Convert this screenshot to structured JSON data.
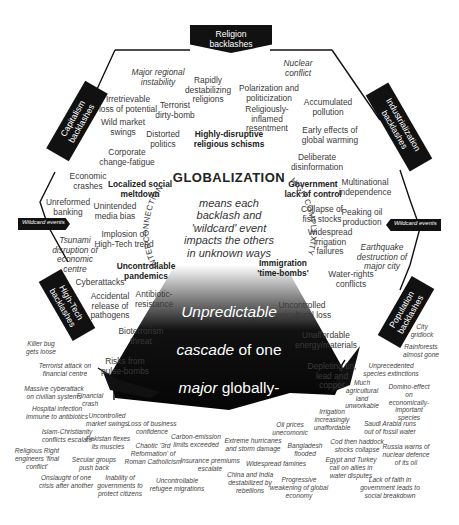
{
  "center": {
    "title": "GLOBALIZATION",
    "subtitle": "means each\nbacklash and\n'wildcard' event\nimpacts the others\nin unknown ways",
    "arc_left": "INTERCONNECTION",
    "arc_right": "HIGH COMPLEXITY",
    "cascade_line1_it": "Unpredictable",
    "cascade_line2a": "cascade",
    "cascade_line2b": " of one",
    "cascade_line3a": "major",
    "cascade_line3b": " globally-",
    "cascade_line4a": "defined",
    "cascade_line4b": " threat to",
    "cascade_line5": "economic security",
    "cascade_line6": "triggering another"
  },
  "backlashes": {
    "religion": "Religion\nbacklashes",
    "capitalism": "Capitalism\nbacklashes",
    "industrialization": "Industrialization\nbacklashes",
    "hightech": "High-Tech\nbacklashes",
    "population": "Population\nbacklashes"
  },
  "wildcards": {
    "left": "Wildcard events",
    "right": "Wildcard events"
  },
  "inner_labels": [
    {
      "t": "Major regional\ninstability",
      "x": 158,
      "y": 68,
      "s": "it"
    },
    {
      "t": "Rapidly\ndestabilizing\nreligions",
      "x": 208,
      "y": 76,
      "s": ""
    },
    {
      "t": "Nuclear\nconflict",
      "x": 298,
      "y": 59,
      "s": "it"
    },
    {
      "t": "Polarization and\npoliticization",
      "x": 269,
      "y": 84,
      "s": ""
    },
    {
      "t": "Irretrievable\nloss of potential",
      "x": 128,
      "y": 95,
      "s": ""
    },
    {
      "t": "Terrorist\ndirty-bomb",
      "x": 175,
      "y": 101,
      "s": ""
    },
    {
      "t": "Religiously-\ninflamed\nresentment",
      "x": 267,
      "y": 105,
      "s": ""
    },
    {
      "t": "Accumulated\npollution",
      "x": 328,
      "y": 98,
      "s": ""
    },
    {
      "t": "Wild market\nswings",
      "x": 123,
      "y": 118,
      "s": ""
    },
    {
      "t": "Distorted\npolitics",
      "x": 163,
      "y": 130,
      "s": ""
    },
    {
      "t": "Highly-disruptive\nreligious schisms",
      "x": 229,
      "y": 130,
      "s": "b"
    },
    {
      "t": "Early effects of\nglobal warming",
      "x": 330,
      "y": 126,
      "s": ""
    },
    {
      "t": "Corporate\nchange-fatigue",
      "x": 127,
      "y": 148,
      "s": ""
    },
    {
      "t": "Deliberate\ndisinformation",
      "x": 317,
      "y": 153,
      "s": ""
    },
    {
      "t": "Economic\ncrashes",
      "x": 88,
      "y": 172,
      "s": ""
    },
    {
      "t": "Localized social\nmeltdown",
      "x": 140,
      "y": 180,
      "s": "b"
    },
    {
      "t": "Government\nlack of control",
      "x": 313,
      "y": 180,
      "s": "b"
    },
    {
      "t": "Multinational\nindependence",
      "x": 365,
      "y": 178,
      "s": ""
    },
    {
      "t": "Unreformed\nbanking",
      "x": 68,
      "y": 198,
      "s": ""
    },
    {
      "t": "Unintended\nmedia bias",
      "x": 115,
      "y": 202,
      "s": ""
    },
    {
      "t": "Collapse of\nfish stocks",
      "x": 322,
      "y": 205,
      "s": ""
    },
    {
      "t": "Peaking oil\nproduction",
      "x": 362,
      "y": 208,
      "s": ""
    },
    {
      "t": "Implosion of\nHigh-Tech trend",
      "x": 124,
      "y": 230,
      "s": ""
    },
    {
      "t": "Widespread\nirrigation\nfailures",
      "x": 330,
      "y": 228,
      "s": ""
    },
    {
      "t": "Tsunami\ndisruption of\neconomic\ncentre",
      "x": 75,
      "y": 236,
      "s": "it"
    },
    {
      "t": "Earthquake\ndestruction of\nmajor city",
      "x": 382,
      "y": 243,
      "s": "it"
    },
    {
      "t": "Immigration\n'time-bombs'",
      "x": 283,
      "y": 259,
      "s": "b"
    },
    {
      "t": "Uncontrollable\npandemics",
      "x": 146,
      "y": 262,
      "s": "b"
    },
    {
      "t": "Water-rights\nconflicts",
      "x": 351,
      "y": 270,
      "s": ""
    },
    {
      "t": "Cyberattacks",
      "x": 100,
      "y": 278,
      "s": ""
    },
    {
      "t": "Accidental\nrelease of\npathogens",
      "x": 110,
      "y": 292,
      "s": ""
    },
    {
      "t": "Antibiotic-\nresistance",
      "x": 154,
      "y": 290,
      "s": ""
    },
    {
      "t": "Uncontrolled\nagricultural loss",
      "x": 302,
      "y": 301,
      "s": ""
    },
    {
      "t": "Bioterrorism\nthreat",
      "x": 141,
      "y": 327,
      "s": ""
    },
    {
      "t": "Unaffordable\nenergy/materials",
      "x": 326,
      "y": 331,
      "s": ""
    },
    {
      "t": "Risks from\npulse-bombs",
      "x": 125,
      "y": 357,
      "s": ""
    },
    {
      "t": "Depleting tin,\nlead and\ncopper",
      "x": 332,
      "y": 362,
      "s": ""
    }
  ],
  "outer_labels": [
    {
      "t": "Killer bug\ngets loose",
      "x": 41,
      "y": 340
    },
    {
      "t": "City\ngridlock",
      "x": 422,
      "y": 323
    },
    {
      "t": "Rainforests\nalmost gone",
      "x": 421,
      "y": 343
    },
    {
      "t": "Terrorist attack on\nfinancial centre",
      "x": 65,
      "y": 362
    },
    {
      "t": "Unprecedented\nspecies extinctions",
      "x": 391,
      "y": 362
    },
    {
      "t": "Massive cyberattack\non civilian systems",
      "x": 54,
      "y": 385
    },
    {
      "t": "Financial\ncrash",
      "x": 90,
      "y": 392
    },
    {
      "t": "Much\nagricultural\nland\nunworkable",
      "x": 362,
      "y": 379
    },
    {
      "t": "Domino-effect on\neconomically-\nimportant species",
      "x": 409,
      "y": 383
    },
    {
      "t": "Hospital infection\nimmune to antibiotics",
      "x": 57,
      "y": 405
    },
    {
      "t": "Uncontrolled\nmarket swings",
      "x": 107,
      "y": 412
    },
    {
      "t": "Irrigation\nincreasingly\nunaffordable",
      "x": 332,
      "y": 408
    },
    {
      "t": "Oil prices\nunecomonic",
      "x": 290,
      "y": 421
    },
    {
      "t": "Saudi Arabia runs\nout of fossil water",
      "x": 390,
      "y": 420
    },
    {
      "t": "Islam-Christianity\nconflicts escalate",
      "x": 67,
      "y": 428
    },
    {
      "t": "Loss of business\nconfidence",
      "x": 152,
      "y": 420
    },
    {
      "t": "Carbon-emission\nlimits exceeded",
      "x": 196,
      "y": 433
    },
    {
      "t": "Extreme hurricanes\nand storm damage",
      "x": 253,
      "y": 437
    },
    {
      "t": "Cod then haddock\nstocks collapse",
      "x": 357,
      "y": 438
    },
    {
      "t": "Pakistan flexes\nits muscles",
      "x": 108,
      "y": 435
    },
    {
      "t": "Chaotic '3rd\nReformation' of\nRoman Catholicism",
      "x": 153,
      "y": 442
    },
    {
      "t": "Bangladesh\nflooded",
      "x": 305,
      "y": 442
    },
    {
      "t": "Russia warns of\nnuclear defence\nof its oil",
      "x": 406,
      "y": 443
    },
    {
      "t": "Religious Right\nengineers 'final\nconflict'",
      "x": 37,
      "y": 447
    },
    {
      "t": "Secular groups\npush back",
      "x": 94,
      "y": 456
    },
    {
      "t": "Insurance premiums\nescalate",
      "x": 210,
      "y": 457
    },
    {
      "t": "Widespread famines",
      "x": 276,
      "y": 460
    },
    {
      "t": "Egypt and Turkey\ncall on allies in\nwater disputes",
      "x": 351,
      "y": 456
    },
    {
      "t": "China and India\ndestabilized by\nrebellions",
      "x": 250,
      "y": 471
    },
    {
      "t": "Progressive\nweakening of global\neconomy",
      "x": 299,
      "y": 476
    },
    {
      "t": "Lack of faith in\ngovernment leads to\nsocial breakdown",
      "x": 390,
      "y": 476
    },
    {
      "t": "Onslaught of one\ncrisis after another",
      "x": 66,
      "y": 474
    },
    {
      "t": "Inability of\ngovernments to\nprotect citizens",
      "x": 120,
      "y": 474
    },
    {
      "t": "Uncontrollable\nrefugee migrations",
      "x": 177,
      "y": 477
    }
  ]
}
